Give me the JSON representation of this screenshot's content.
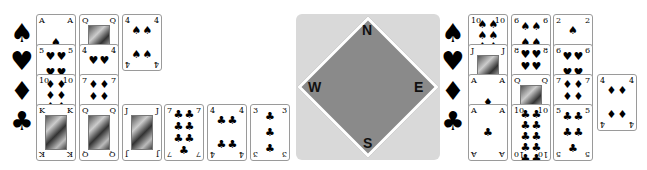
{
  "suit_labels": {
    "spades": "♠",
    "hearts": "♥",
    "diamonds": "♦",
    "clubs": "♣"
  },
  "compass": {
    "north": "N",
    "south": "S",
    "east": "E",
    "west": "W"
  },
  "west_hand": {
    "spades": [
      "A",
      "Q",
      "4"
    ],
    "hearts": [
      "5",
      "4"
    ],
    "diamonds": [
      "10",
      "7"
    ],
    "clubs": [
      "K",
      "Q",
      "J",
      "7",
      "4",
      "3"
    ]
  },
  "east_hand": {
    "spades": [
      "10",
      "6",
      "2"
    ],
    "hearts": [
      "J",
      "8",
      "6"
    ],
    "diamonds": [
      "A",
      "Q",
      "7",
      "4"
    ],
    "clubs": [
      "A",
      "10",
      "5"
    ]
  }
}
